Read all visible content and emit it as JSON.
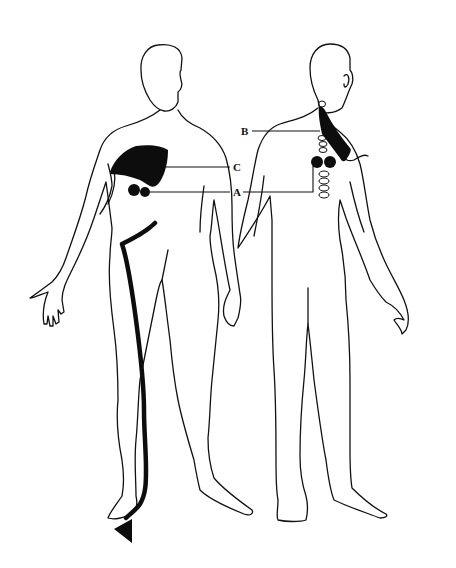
{
  "figure": {
    "type": "anatomical-referred-pain-diagram",
    "views": [
      {
        "name": "front-view",
        "description": "Anterior body outline"
      },
      {
        "name": "back-view",
        "description": "Posterior body outline with cervical/thoracic spine"
      }
    ],
    "labels": {
      "A": "A",
      "B": "B",
      "C": "C"
    },
    "regions": [
      {
        "label": "A",
        "description": "Paired dark circles (front chest and upper back, beside spine)"
      },
      {
        "label": "B",
        "description": "Dark triangular shaded area from neck to upper back/shoulder"
      },
      {
        "label": "C",
        "description": "Dark shaded area over upper right chest / pectoral region"
      }
    ],
    "pathway": {
      "description": "Thick dark line running from lower abdomen down the leg ending in an arrowhead at the foot"
    },
    "colors": {
      "ink": "#111111",
      "background": "#ffffff"
    }
  }
}
